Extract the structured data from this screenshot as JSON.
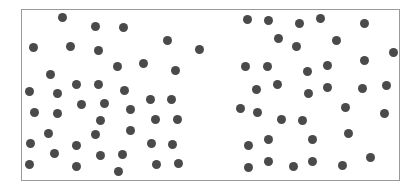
{
  "figure": {
    "frame": {
      "left": 21,
      "top": 9,
      "right": 399,
      "bottom": 180,
      "border_color": "#9a9a9a"
    },
    "dot_color": "#4a4a4a",
    "dot_diameter": 9
  },
  "clusters": [
    {
      "name": "left",
      "count": 42,
      "dots": [
        [
          62,
          17
        ],
        [
          95,
          26
        ],
        [
          123,
          27
        ],
        [
          33,
          47
        ],
        [
          70,
          46
        ],
        [
          98,
          50
        ],
        [
          167,
          40
        ],
        [
          199,
          49
        ],
        [
          117,
          66
        ],
        [
          143,
          63
        ],
        [
          175,
          70
        ],
        [
          50,
          74
        ],
        [
          76,
          84
        ],
        [
          98,
          84
        ],
        [
          124,
          90
        ],
        [
          29,
          91
        ],
        [
          57,
          93
        ],
        [
          81,
          104
        ],
        [
          104,
          103
        ],
        [
          130,
          109
        ],
        [
          150,
          99
        ],
        [
          171,
          99
        ],
        [
          34,
          112
        ],
        [
          57,
          113
        ],
        [
          100,
          120
        ],
        [
          155,
          119
        ],
        [
          177,
          119
        ],
        [
          48,
          133
        ],
        [
          95,
          134
        ],
        [
          130,
          130
        ],
        [
          30,
          143
        ],
        [
          76,
          145
        ],
        [
          151,
          143
        ],
        [
          172,
          144
        ],
        [
          54,
          153
        ],
        [
          100,
          155
        ],
        [
          122,
          154
        ],
        [
          29,
          164
        ],
        [
          76,
          166
        ],
        [
          118,
          171
        ],
        [
          156,
          164
        ],
        [
          178,
          163
        ]
      ]
    },
    {
      "name": "right",
      "count": 37,
      "dots": [
        [
          247,
          19
        ],
        [
          268,
          20
        ],
        [
          299,
          23
        ],
        [
          320,
          18
        ],
        [
          364,
          23
        ],
        [
          278,
          38
        ],
        [
          296,
          46
        ],
        [
          336,
          40
        ],
        [
          393,
          52
        ],
        [
          245,
          66
        ],
        [
          267,
          66
        ],
        [
          307,
          71
        ],
        [
          327,
          65
        ],
        [
          364,
          60
        ],
        [
          256,
          89
        ],
        [
          277,
          84
        ],
        [
          308,
          93
        ],
        [
          327,
          87
        ],
        [
          362,
          88
        ],
        [
          386,
          85
        ],
        [
          240,
          108
        ],
        [
          257,
          112
        ],
        [
          345,
          107
        ],
        [
          384,
          113
        ],
        [
          281,
          119
        ],
        [
          302,
          120
        ],
        [
          248,
          145
        ],
        [
          268,
          139
        ],
        [
          312,
          139
        ],
        [
          348,
          133
        ],
        [
          248,
          167
        ],
        [
          268,
          161
        ],
        [
          293,
          166
        ],
        [
          312,
          161
        ],
        [
          342,
          165
        ],
        [
          370,
          157
        ]
      ]
    }
  ]
}
